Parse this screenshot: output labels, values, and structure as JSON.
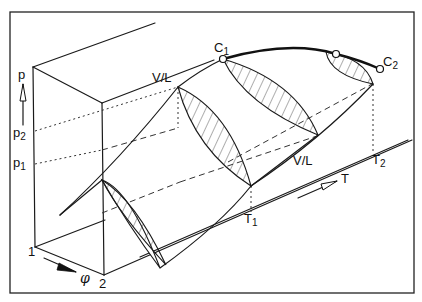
{
  "figure": {
    "colors": {
      "line": "#111111",
      "background": "#ffffff"
    }
  },
  "labels": {
    "p_axis": "p",
    "p2": "p",
    "p2_sub": "2",
    "p1": "p",
    "p1_sub": "1",
    "T_axis": "T",
    "T1": "T",
    "T1_sub": "1",
    "T2": "T",
    "T2_sub": "2",
    "phi_axis": "φ",
    "comp1": "1",
    "comp2": "2",
    "C1": "C",
    "C1_sub": "1",
    "C2": "C",
    "C2_sub": "2",
    "vl_upper": "V/L",
    "vl_lower": "V/L"
  },
  "critical_points": [
    {
      "name": "C1",
      "x": 223,
      "y": 59
    },
    {
      "name": "mid",
      "x": 336,
      "y": 54
    },
    {
      "name": "C2",
      "x": 380,
      "y": 69
    }
  ]
}
